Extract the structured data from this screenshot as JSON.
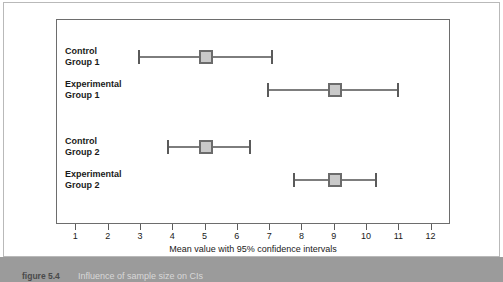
{
  "figure": {
    "caption_number": "figure 5.4",
    "caption_text": "Influence of sample size on CIs"
  },
  "chart_data": {
    "type": "scatter",
    "title": "",
    "subtitle": "",
    "xlabel": "Mean value with 95% confidence intervals",
    "ylabel": "",
    "xlim": [
      0.4,
      12.6
    ],
    "xticks": [
      1,
      2,
      3,
      4,
      5,
      6,
      7,
      8,
      9,
      10,
      11,
      12
    ],
    "xtick_labels": [
      "1",
      "2",
      "3",
      "4",
      "5",
      "6",
      "7",
      "8",
      "9",
      "10",
      "11",
      "12"
    ],
    "grid": false,
    "legend": false,
    "orientation": "horizontal",
    "error_bars": "95% confidence intervals",
    "categories": [
      "Control Group 1",
      "Experimental Group 1",
      "Control Group 2",
      "Experimental Group 2"
    ],
    "points": [
      {
        "label_line1": "Control",
        "label_line2": "Group 1",
        "mean": 5.0,
        "ci_low": 2.9,
        "ci_high": 7.1
      },
      {
        "label_line1": "Experimental",
        "label_line2": "Group 1",
        "mean": 9.0,
        "ci_low": 6.9,
        "ci_high": 11.0
      },
      {
        "label_line1": "Control",
        "label_line2": "Group 2",
        "mean": 5.0,
        "ci_low": 3.8,
        "ci_high": 6.4
      },
      {
        "label_line1": "Experimental",
        "label_line2": "Group 2",
        "mean": 9.0,
        "ci_low": 7.7,
        "ci_high": 10.3
      }
    ],
    "colors": {
      "marker_fill": "#c9c9c9",
      "marker_border": "#6b6b6b",
      "bar_line": "#7d7d7d",
      "frame": "#6d6d6d",
      "text": "#1a1a1a",
      "caption_bar": "#9b9b9b"
    }
  }
}
